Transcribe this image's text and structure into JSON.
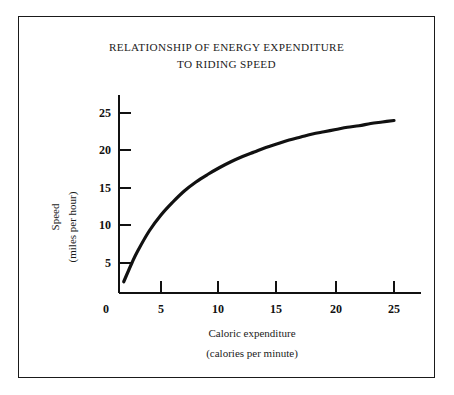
{
  "figure": {
    "background_color": "#ffffff",
    "frame_color": "#1a1a1a",
    "curve_color": "#111111"
  },
  "title": {
    "line1": "RELATIONSHIP OF ENERGY EXPENDITURE",
    "line2": "TO RIDING SPEED"
  },
  "axes": {
    "x_label_line1": "Caloric expenditure",
    "x_label_line2": "(calories per minute)",
    "y_label_line1": "Speed",
    "y_label_line2": "(miles per hour)"
  },
  "chart_data": {
    "type": "line",
    "title": "RELATIONSHIP OF ENERGY EXPENDITURE TO RIDING SPEED",
    "xlabel": "Caloric expenditure (calories per minute)",
    "ylabel": "Speed (miles per hour)",
    "xlim": [
      0,
      26.5
    ],
    "ylim": [
      0,
      26.5
    ],
    "xticks": [
      0,
      5,
      10,
      15,
      20,
      25
    ],
    "yticks": [
      5,
      10,
      15,
      20,
      25
    ],
    "xtick_labels": [
      "0",
      "5",
      "10",
      "15",
      "20",
      "25"
    ],
    "ytick_labels": [
      "5",
      "10",
      "15",
      "20",
      "25"
    ],
    "grid": false,
    "legend": false,
    "series": [
      {
        "name": "Speed vs caloric expenditure",
        "x": [
          1.8,
          2.5,
          3,
          4,
          5,
          6,
          7,
          8,
          9,
          10,
          11,
          12,
          13,
          14,
          15,
          16,
          17,
          18,
          19,
          20,
          21,
          22,
          23,
          24,
          25
        ],
        "y": [
          2.5,
          5.0,
          6.6,
          9.3,
          11.4,
          13.1,
          14.6,
          15.8,
          16.8,
          17.7,
          18.5,
          19.2,
          19.8,
          20.4,
          20.9,
          21.4,
          21.8,
          22.2,
          22.5,
          22.8,
          23.1,
          23.3,
          23.6,
          23.8,
          24.0
        ]
      }
    ]
  }
}
